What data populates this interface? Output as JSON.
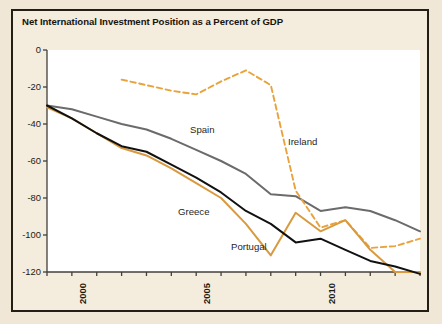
{
  "figure": {
    "title": "Net International Investment Position as a Percent of GDP",
    "background_color": "#f0e7d6",
    "panel_color": "#f4ecdd",
    "plot_color": "#ffffff",
    "frame_color": "#231f16"
  },
  "labels": {
    "spain": "Spain",
    "ireland": "Ireland",
    "greece": "Greece",
    "portugal": "Portugal"
  },
  "chart_data": {
    "type": "line",
    "title": "Net International Investment Position as a Percent of GDP",
    "xlabel": "",
    "ylabel": "",
    "xlim": [
      1999,
      2014
    ],
    "ylim": [
      -120,
      0
    ],
    "yticks": [
      0,
      -20,
      -40,
      -60,
      -80,
      -100,
      -120
    ],
    "ytick_labels": [
      "0",
      "-20",
      "-40",
      "-60",
      "-80",
      "-100",
      "-120"
    ],
    "xticks": [
      1999,
      2000,
      2001,
      2002,
      2003,
      2004,
      2005,
      2006,
      2007,
      2008,
      2009,
      2010,
      2011,
      2012,
      2013,
      2014
    ],
    "xtick_labels_shown": [
      "2000",
      "2005",
      "2010"
    ],
    "xtick_labels_shown_at": [
      2000,
      2005,
      2010
    ],
    "grid": false,
    "legend_position": "inline-annotations",
    "series": [
      {
        "name": "Spain",
        "color": "#6b6b6b",
        "style": "solid",
        "x": [
          1999,
          2000,
          2001,
          2002,
          2003,
          2004,
          2005,
          2006,
          2007,
          2008,
          2009,
          2010,
          2011,
          2012,
          2013,
          2014
        ],
        "values": [
          -30,
          -32,
          -36,
          -40,
          -43,
          -48,
          -54,
          -60,
          -67,
          -78,
          -79,
          -87,
          -85,
          -87,
          -92,
          -98
        ]
      },
      {
        "name": "Ireland",
        "color": "#e8a33d",
        "style": "dashed",
        "x": [
          2002,
          2003,
          2004,
          2005,
          2006,
          2007,
          2008,
          2009,
          2010,
          2011,
          2012,
          2013,
          2014
        ],
        "values": [
          -16,
          -19,
          -22,
          -24,
          -17,
          -11,
          -19,
          -76,
          -96,
          -92,
          -107,
          -106,
          -102
        ]
      },
      {
        "name": "Greece",
        "color": "#d99a3f",
        "style": "solid",
        "x": [
          1999,
          2000,
          2001,
          2002,
          2003,
          2004,
          2005,
          2006,
          2007,
          2008,
          2009,
          2010,
          2011,
          2012,
          2013,
          2014
        ],
        "values": [
          -31,
          -37,
          -45,
          -53,
          -57,
          -64,
          -72,
          -80,
          -94,
          -111,
          -88,
          -98,
          -92,
          -108,
          -120,
          -120
        ]
      },
      {
        "name": "Portugal",
        "color": "#111111",
        "style": "solid",
        "x": [
          1999,
          2000,
          2001,
          2002,
          2003,
          2004,
          2005,
          2006,
          2007,
          2008,
          2009,
          2010,
          2011,
          2012,
          2013,
          2014
        ],
        "values": [
          -30,
          -37,
          -45,
          -52,
          -55,
          -62,
          -69,
          -77,
          -87,
          -94,
          -104,
          -102,
          -108,
          -114,
          -117,
          -121
        ]
      }
    ]
  }
}
